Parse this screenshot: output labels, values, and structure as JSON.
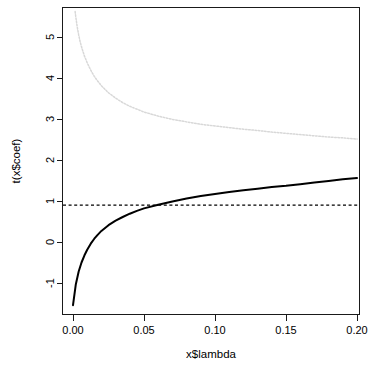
{
  "chart_data": {
    "type": "line",
    "title": "",
    "subtitle": "",
    "xlabel": "x$lambda",
    "ylabel": "t(x$coef)",
    "xlim": [
      0.0,
      0.2
    ],
    "ylim": [
      -1.55,
      5.65
    ],
    "xticks": [
      0.0,
      0.05,
      0.1,
      0.15,
      0.2
    ],
    "xticklabels": [
      "0.00",
      "0.05",
      "0.10",
      "0.15",
      "0.20"
    ],
    "yticks": [
      -1,
      0,
      1,
      2,
      3,
      4,
      5
    ],
    "yticklabels": [
      "-1",
      "0",
      "1",
      "2",
      "3",
      "4",
      "5"
    ],
    "grid": false,
    "legend": "none",
    "box": "full-rectangle",
    "series": [
      {
        "name": "coefficient-path-1",
        "style": "solid",
        "color": "#000000",
        "width": 2.0,
        "x": [
          0.0,
          0.002,
          0.004,
          0.006,
          0.008,
          0.01,
          0.0125,
          0.015,
          0.0175,
          0.02,
          0.025,
          0.03,
          0.035,
          0.04,
          0.045,
          0.05,
          0.06,
          0.07,
          0.08,
          0.09,
          0.1,
          0.11,
          0.12,
          0.13,
          0.14,
          0.15,
          0.16,
          0.17,
          0.18,
          0.19,
          0.2
        ],
        "y": [
          -1.54,
          -1.03,
          -0.72,
          -0.5,
          -0.33,
          -0.19,
          -0.04,
          0.08,
          0.18,
          0.27,
          0.41,
          0.52,
          0.61,
          0.69,
          0.76,
          0.82,
          0.91,
          0.99,
          1.06,
          1.12,
          1.17,
          1.22,
          1.26,
          1.3,
          1.34,
          1.37,
          1.41,
          1.45,
          1.49,
          1.53,
          1.56
        ]
      },
      {
        "name": "coefficient-path-2",
        "style": "dotted",
        "color": "#d8d8d8",
        "width": 1.5,
        "x": [
          0.0015,
          0.002,
          0.003,
          0.004,
          0.005,
          0.006,
          0.008,
          0.01,
          0.0125,
          0.015,
          0.0175,
          0.02,
          0.025,
          0.03,
          0.035,
          0.04,
          0.045,
          0.05,
          0.06,
          0.07,
          0.08,
          0.09,
          0.1,
          0.11,
          0.12,
          0.13,
          0.14,
          0.15,
          0.16,
          0.17,
          0.18,
          0.19,
          0.2
        ],
        "y": [
          5.62,
          5.48,
          5.24,
          5.05,
          4.89,
          4.76,
          4.54,
          4.37,
          4.19,
          4.04,
          3.92,
          3.81,
          3.64,
          3.51,
          3.4,
          3.31,
          3.24,
          3.17,
          3.07,
          2.99,
          2.93,
          2.87,
          2.83,
          2.79,
          2.75,
          2.72,
          2.68,
          2.65,
          2.62,
          2.59,
          2.56,
          2.54,
          2.51
        ]
      }
    ],
    "reference_lines": [
      {
        "name": "ols-reference-line",
        "orientation": "horizontal",
        "value": 0.9,
        "style": "dashed",
        "color": "#000000",
        "width": 1.2
      }
    ]
  },
  "axes": {
    "x_label": "x$lambda",
    "y_label": "t(x$coef)"
  }
}
